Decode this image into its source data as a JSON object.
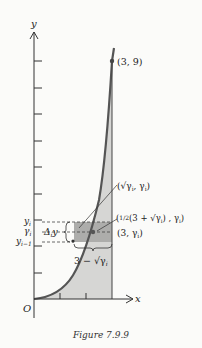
{
  "figure": {
    "caption": "Figure 7.9.9",
    "axes": {
      "x_label": "x",
      "y_label": "y",
      "origin_label": "O"
    },
    "curve": {
      "equation": "y = x^2",
      "endpoint_label": "(3, 9)"
    },
    "strip_labels": {
      "y_i": "y",
      "y_i_sub": "i",
      "gamma_i": "γ",
      "gamma_i_sub": "i",
      "y_im1": "y",
      "y_im1_sub": "i−1",
      "delta": "Δ",
      "delta_sub": "i",
      "delta_y": "y",
      "width": "3 − √γ",
      "width_sub": "i",
      "point_curve": "(√γ",
      "point_curve_sub": "i",
      "point_curve_tail": ", γ",
      "point_curve_tail_sub": "i",
      "point_curve_end": ")",
      "centroid_pre": "(",
      "centroid_frac": "1/2",
      "centroid_mid": "(3 + √γ",
      "centroid_mid_sub": "i",
      "centroid_tail": ") , γ",
      "centroid_tail_sub": "i",
      "centroid_end": ")",
      "point_right": "(3, γ",
      "point_right_sub": "i",
      "point_right_end": ")"
    },
    "colors": {
      "region": "#d4d4d2",
      "strip": "#aeaeac",
      "curve": "#555555",
      "axis": "#333333"
    }
  }
}
